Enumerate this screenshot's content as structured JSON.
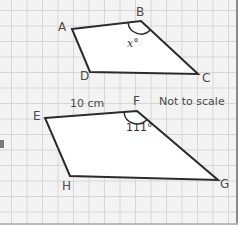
{
  "diagram": {
    "note": "Not to scale",
    "shape_abcd": {
      "vertices": [
        {
          "name": "A",
          "x": 72,
          "y": 29
        },
        {
          "name": "B",
          "x": 141,
          "y": 21
        },
        {
          "name": "C",
          "x": 198,
          "y": 74
        },
        {
          "name": "D",
          "x": 90,
          "y": 72
        }
      ],
      "angle_label": "x°",
      "angle_at": "B"
    },
    "shape_efgh": {
      "vertices": [
        {
          "name": "E",
          "x": 45,
          "y": 118
        },
        {
          "name": "F",
          "x": 137,
          "y": 111
        },
        {
          "name": "G",
          "x": 218,
          "y": 180
        },
        {
          "name": "H",
          "x": 70,
          "y": 176
        }
      ],
      "side_label": "10 cm",
      "side": "EF",
      "angle_label": "111°",
      "angle_at": "F"
    },
    "colors": {
      "line": "#2b2b2b",
      "fill": "#ffffff",
      "grid": "#d6d6d6",
      "background": "#f3f3f3",
      "text": "#4a4a4a"
    }
  }
}
